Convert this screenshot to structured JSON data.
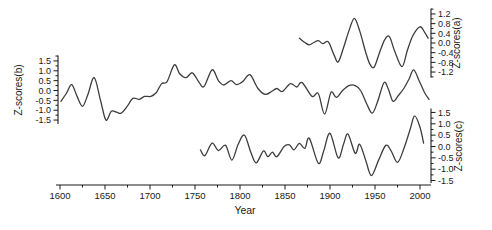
{
  "figure": {
    "xlabel": "Year",
    "colors": {
      "background": "#ffffff",
      "curve": "#3d3d3d",
      "axis": "#1a1a1a",
      "text": "#1a1a1a"
    },
    "x_axis": {
      "tick_labels": [
        "1600",
        "1650",
        "1700",
        "1750",
        "1800",
        "1850",
        "1900",
        "1950",
        "2000"
      ],
      "major_tick_years": [
        1600,
        1650,
        1700,
        1750,
        1800,
        1850,
        1900,
        1950,
        2000
      ],
      "minor_step_years": 25,
      "range_years": [
        1596,
        2012
      ]
    },
    "axes": [
      {
        "id": "b",
        "title": "Z-scores(b)",
        "side": "left",
        "tick_labels": [
          "1.5",
          "1.0",
          "0.5",
          "0.0",
          "-0.5",
          "-1.0",
          "-1.5"
        ],
        "major_ticks": [
          1.5,
          1.0,
          0.5,
          0.0,
          -0.5,
          -1.0,
          -1.5
        ],
        "minor_step": 0.25
      },
      {
        "id": "a",
        "title": "Z-scores(a)",
        "side": "right",
        "tick_labels": [
          "1.2",
          "0.8",
          "0.4",
          "0.0",
          "-0.4",
          "-0.8",
          "-1.2"
        ],
        "major_ticks": [
          1.2,
          0.8,
          0.4,
          0.0,
          -0.4,
          -0.8,
          -1.2
        ],
        "minor_step": 0.2
      },
      {
        "id": "c",
        "title": "Z-scores(c)",
        "side": "right",
        "tick_labels": [
          "1.5",
          "1.0",
          "0.5",
          "0.0",
          "-0.5",
          "-1.0",
          "-1.5"
        ],
        "major_ticks": [
          1.5,
          1.0,
          0.5,
          0.0,
          -0.5,
          -1.0,
          -1.5
        ],
        "minor_step": 0.25
      }
    ]
  },
  "chart_data": {
    "type": "line",
    "title": "",
    "xlabel": "Year",
    "ylabel": "Z-scores",
    "x_range": [
      1600,
      2010
    ],
    "grid": false,
    "legend": false,
    "series": [
      {
        "name": "Z-scores(b)",
        "axis": "b",
        "ylim": [
          -1.5,
          1.5
        ],
        "points": [
          [
            1601,
            -0.55
          ],
          [
            1607,
            -0.15
          ],
          [
            1613,
            0.3
          ],
          [
            1619,
            -0.3
          ],
          [
            1625,
            -0.8
          ],
          [
            1631,
            -0.2
          ],
          [
            1638,
            0.65
          ],
          [
            1645,
            -0.5
          ],
          [
            1651,
            -1.5
          ],
          [
            1657,
            -1.05
          ],
          [
            1663,
            -1.1
          ],
          [
            1668,
            -1.15
          ],
          [
            1674,
            -0.85
          ],
          [
            1681,
            -0.4
          ],
          [
            1688,
            -0.45
          ],
          [
            1694,
            -0.3
          ],
          [
            1701,
            -0.3
          ],
          [
            1707,
            -0.1
          ],
          [
            1713,
            0.35
          ],
          [
            1719,
            0.45
          ],
          [
            1727,
            1.3
          ],
          [
            1733,
            0.85
          ],
          [
            1740,
            0.65
          ],
          [
            1747,
            0.9
          ],
          [
            1754,
            0.45
          ],
          [
            1760,
            0.2
          ],
          [
            1769,
            1.05
          ],
          [
            1776,
            0.5
          ],
          [
            1782,
            0.28
          ],
          [
            1790,
            0.5
          ],
          [
            1796,
            0.3
          ],
          [
            1803,
            0.45
          ],
          [
            1811,
            0.8
          ],
          [
            1820,
            0.1
          ],
          [
            1828,
            -0.2
          ],
          [
            1835,
            -0.05
          ],
          [
            1841,
            0.1
          ],
          [
            1847,
            -0.05
          ],
          [
            1856,
            0.35
          ],
          [
            1863,
            0.18
          ],
          [
            1869,
            0.4
          ],
          [
            1880,
            -0.3
          ],
          [
            1887,
            -0.15
          ],
          [
            1894,
            -1.2
          ],
          [
            1901,
            -0.1
          ],
          [
            1907,
            -0.35
          ],
          [
            1914,
            0.0
          ],
          [
            1921,
            0.25
          ],
          [
            1928,
            0.25
          ],
          [
            1934,
            0.0
          ],
          [
            1941,
            -0.7
          ],
          [
            1947,
            -1.15
          ],
          [
            1953,
            -0.55
          ],
          [
            1960,
            0.4
          ],
          [
            1965,
            0.05
          ],
          [
            1970,
            -0.55
          ],
          [
            1976,
            -0.25
          ],
          [
            1982,
            0.1
          ],
          [
            1988,
            0.6
          ],
          [
            1993,
            1.05
          ],
          [
            1999,
            0.5
          ],
          [
            2005,
            -0.1
          ],
          [
            2010,
            -0.45
          ]
        ]
      },
      {
        "name": "Z-scores(a)",
        "axis": "a",
        "ylim": [
          -1.2,
          1.2
        ],
        "points": [
          [
            1866,
            0.2
          ],
          [
            1872,
            0.02
          ],
          [
            1877,
            -0.08
          ],
          [
            1882,
            0.02
          ],
          [
            1887,
            0.1
          ],
          [
            1892,
            -0.03
          ],
          [
            1898,
            0.05
          ],
          [
            1904,
            -0.45
          ],
          [
            1909,
            -0.78
          ],
          [
            1915,
            -0.2
          ],
          [
            1921,
            0.5
          ],
          [
            1927,
            1.02
          ],
          [
            1933,
            0.5
          ],
          [
            1939,
            -0.3
          ],
          [
            1944,
            -0.85
          ],
          [
            1949,
            -1.0
          ],
          [
            1955,
            -0.4
          ],
          [
            1961,
            0.15
          ],
          [
            1966,
            0.26
          ],
          [
            1972,
            -0.35
          ],
          [
            1980,
            -0.98
          ],
          [
            1986,
            -0.3
          ],
          [
            1992,
            0.3
          ],
          [
            2000,
            0.67
          ],
          [
            2005,
            0.45
          ],
          [
            2009,
            0.2
          ]
        ]
      },
      {
        "name": "Z-scores(c)",
        "axis": "c",
        "ylim": [
          -1.5,
          1.5
        ],
        "points": [
          [
            1756,
            -0.15
          ],
          [
            1761,
            -0.4
          ],
          [
            1769,
            0.15
          ],
          [
            1776,
            -0.18
          ],
          [
            1784,
            0.05
          ],
          [
            1791,
            -0.6
          ],
          [
            1798,
            0.1
          ],
          [
            1805,
            0.5
          ],
          [
            1812,
            -0.25
          ],
          [
            1818,
            -0.72
          ],
          [
            1826,
            -0.2
          ],
          [
            1831,
            -0.45
          ],
          [
            1836,
            -0.25
          ],
          [
            1841,
            -0.45
          ],
          [
            1849,
            0.0
          ],
          [
            1855,
            0.07
          ],
          [
            1860,
            -0.15
          ],
          [
            1866,
            0.14
          ],
          [
            1872,
            -0.08
          ],
          [
            1877,
            0.36
          ],
          [
            1887,
            -0.74
          ],
          [
            1893,
            -0.2
          ],
          [
            1900,
            0.58
          ],
          [
            1909,
            -0.5
          ],
          [
            1915,
            0.1
          ],
          [
            1920,
            0.55
          ],
          [
            1928,
            -0.3
          ],
          [
            1933,
            0.1
          ],
          [
            1940,
            -0.65
          ],
          [
            1946,
            -1.28
          ],
          [
            1954,
            -0.6
          ],
          [
            1962,
            0.05
          ],
          [
            1968,
            -0.2
          ],
          [
            1975,
            -0.7
          ],
          [
            1982,
            -0.1
          ],
          [
            1989,
            0.75
          ],
          [
            1994,
            1.35
          ],
          [
            2000,
            0.85
          ],
          [
            2004,
            0.15
          ]
        ]
      }
    ]
  }
}
